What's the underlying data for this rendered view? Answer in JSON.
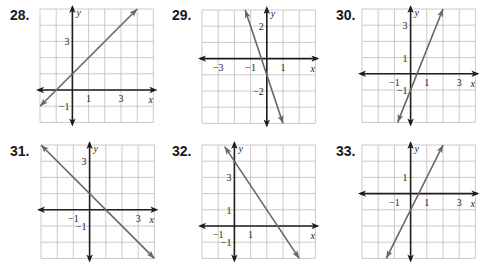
{
  "colors": {
    "grid": "#c4c4c4",
    "axis": "#1e1e1e",
    "line": "#666666",
    "background": "#ffffff"
  },
  "chart_data": [
    {
      "type": "line",
      "label": "28.",
      "xlabel": "x",
      "ylabel": "y",
      "xlim": [
        -2,
        5
      ],
      "ylim": [
        -2,
        5
      ],
      "grid": true,
      "x_tick_labels": [
        {
          "v": 1,
          "t": "1"
        },
        {
          "v": 3,
          "t": "3"
        }
      ],
      "y_tick_labels": [
        {
          "v": 3,
          "t": "3"
        },
        {
          "v": -1,
          "t": "−1"
        }
      ],
      "equation": "y = x + 1",
      "slope": 1,
      "intercept": 1,
      "segment": [
        [
          -2,
          -1
        ],
        [
          4,
          5
        ]
      ]
    },
    {
      "type": "line",
      "label": "29.",
      "xlabel": "x",
      "ylabel": "y",
      "xlim": [
        -4,
        3
      ],
      "ylim": [
        -4,
        3
      ],
      "grid": true,
      "x_tick_labels": [
        {
          "v": -3,
          "t": "−3"
        },
        {
          "v": -1,
          "t": "−1"
        },
        {
          "v": 1,
          "t": "1"
        }
      ],
      "y_tick_labels": [
        {
          "v": 2,
          "t": "2"
        },
        {
          "v": -2,
          "t": "−2"
        }
      ],
      "equation": "y = -3x - 1",
      "slope": -3,
      "intercept": -1,
      "segment": [
        [
          -1.333,
          3
        ],
        [
          1,
          -4
        ]
      ]
    },
    {
      "type": "line",
      "label": "30.",
      "xlabel": "x",
      "ylabel": "y",
      "xlim": [
        -3,
        4
      ],
      "ylim": [
        -3,
        4
      ],
      "grid": true,
      "x_tick_labels": [
        {
          "v": -1,
          "t": "−1"
        },
        {
          "v": 1,
          "t": "1"
        },
        {
          "v": 3,
          "t": "3"
        }
      ],
      "y_tick_labels": [
        {
          "v": 3,
          "t": "3"
        },
        {
          "v": 1,
          "t": "1"
        },
        {
          "v": -1,
          "t": "−1"
        }
      ],
      "equation": "y = 2.5x - 1",
      "slope": 2.5,
      "intercept": -1,
      "segment": [
        [
          -0.8,
          -3
        ],
        [
          2,
          4
        ]
      ]
    },
    {
      "type": "line",
      "label": "31.",
      "xlabel": "x",
      "ylabel": "y",
      "xlim": [
        -3,
        4
      ],
      "ylim": [
        -3,
        4
      ],
      "grid": true,
      "x_tick_labels": [
        {
          "v": -1,
          "t": "−1"
        },
        {
          "v": 3,
          "t": "3"
        }
      ],
      "y_tick_labels": [
        {
          "v": 3,
          "t": "3"
        },
        {
          "v": -1,
          "t": "−1"
        }
      ],
      "equation": "y = -x + 1",
      "slope": -1,
      "intercept": 1,
      "segment": [
        [
          -3,
          4
        ],
        [
          4,
          -3
        ]
      ]
    },
    {
      "type": "line",
      "label": "32.",
      "xlabel": "x",
      "ylabel": "y",
      "xlim": [
        -2,
        5
      ],
      "ylim": [
        -2,
        5
      ],
      "grid": true,
      "x_tick_labels": [
        {
          "v": -1,
          "t": "−1"
        },
        {
          "v": 1,
          "t": "1"
        }
      ],
      "y_tick_labels": [
        {
          "v": 3,
          "t": "3"
        },
        {
          "v": 1,
          "t": "1"
        },
        {
          "v": -1,
          "t": "−1"
        }
      ],
      "equation": "y = -1.5x + 4",
      "slope": -1.5,
      "intercept": 4,
      "segment": [
        [
          -0.6,
          4.9
        ],
        [
          4,
          -2
        ]
      ]
    },
    {
      "type": "line",
      "label": "33.",
      "xlabel": "x",
      "ylabel": "y",
      "xlim": [
        -3,
        4
      ],
      "ylim": [
        -4,
        3
      ],
      "grid": true,
      "x_tick_labels": [
        {
          "v": -1,
          "t": "−1"
        },
        {
          "v": 1,
          "t": "1"
        },
        {
          "v": 3,
          "t": "3"
        }
      ],
      "y_tick_labels": [
        {
          "v": 1,
          "t": "1"
        }
      ],
      "equation": "y = 2x - 1",
      "slope": 2,
      "intercept": -1,
      "segment": [
        [
          -1.5,
          -4
        ],
        [
          2,
          3
        ]
      ]
    }
  ],
  "layout": [
    {
      "label_pos": [
        10,
        7
      ],
      "grid_origin": [
        40,
        9
      ]
    },
    {
      "label_pos": [
        172,
        7
      ],
      "grid_origin": [
        202,
        10
      ]
    },
    {
      "label_pos": [
        336,
        7
      ],
      "grid_origin": [
        362,
        9
      ]
    },
    {
      "label_pos": [
        10,
        143
      ],
      "grid_origin": [
        41,
        145
      ]
    },
    {
      "label_pos": [
        172,
        143
      ],
      "grid_origin": [
        202,
        145
      ]
    },
    {
      "label_pos": [
        336,
        143
      ],
      "grid_origin": [
        362,
        145
      ]
    }
  ]
}
